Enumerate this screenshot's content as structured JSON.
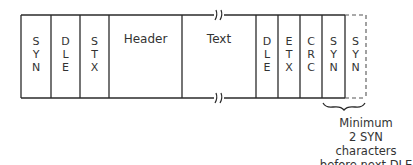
{
  "diagram": {
    "title": "",
    "fields": [
      {
        "id": "syn1",
        "chars": [
          "S",
          "Y",
          "N"
        ],
        "dashed": false
      },
      {
        "id": "dle1",
        "chars": [
          "D",
          "L",
          "E"
        ],
        "dashed": false
      },
      {
        "id": "stx",
        "chars": [
          "S",
          "T",
          "X"
        ],
        "dashed": false
      },
      {
        "id": "header",
        "label": "Header",
        "dashed": false
      },
      {
        "id": "text",
        "label": "Text",
        "dashed": false,
        "broken": true
      },
      {
        "id": "dle2",
        "chars": [
          "D",
          "L",
          "E"
        ],
        "dashed": false
      },
      {
        "id": "etx",
        "chars": [
          "E",
          "T",
          "X"
        ],
        "dashed": false
      },
      {
        "id": "crc",
        "chars": [
          "C",
          "R",
          "C"
        ],
        "dashed": false
      },
      {
        "id": "syn2",
        "chars": [
          "S",
          "Y",
          "N"
        ],
        "dashed": false
      },
      {
        "id": "syn3",
        "chars": [
          "S",
          "Y",
          "N"
        ],
        "dashed": true
      }
    ],
    "annotation": {
      "line1": "Minimum",
      "line2": "2 SYN characters",
      "line3": "before next DLE"
    },
    "colors": {
      "stroke": "#2a2a2a",
      "text": "#333333",
      "background": "#ffffff"
    }
  }
}
